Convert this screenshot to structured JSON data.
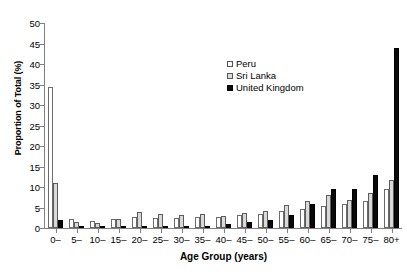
{
  "chart_data": {
    "type": "bar",
    "title": "",
    "xlabel": "Age Group (years)",
    "ylabel": "Proportion of Total (%)",
    "ylim": [
      0,
      50
    ],
    "ytick_step": 5,
    "yticks": [
      "0",
      "5",
      "10",
      "15",
      "20",
      "25",
      "30",
      "35",
      "40",
      "45",
      "50"
    ],
    "grid": false,
    "legend_position": "upper-center-right",
    "categories": [
      "0–",
      "5–",
      "10–",
      "15–",
      "20–",
      "25–",
      "30–",
      "35–",
      "40–",
      "45–",
      "50–",
      "55–",
      "60–",
      "65–",
      "70–",
      "75–",
      "80+"
    ],
    "series": [
      {
        "name": "Peru",
        "style": "open-white",
        "values": [
          34.5,
          2.2,
          1.7,
          2.1,
          2.6,
          2.4,
          2.4,
          2.8,
          2.6,
          3.1,
          3.4,
          4.2,
          4.6,
          5.3,
          5.9,
          6.6,
          9.4
        ]
      },
      {
        "name": "Sri Lanka",
        "style": "stippled-gray",
        "values": [
          11.0,
          1.5,
          1.2,
          2.3,
          3.9,
          3.4,
          3.1,
          3.3,
          3.0,
          3.7,
          4.2,
          5.7,
          6.5,
          8.1,
          6.9,
          8.5,
          11.7
        ]
      },
      {
        "name": "United Kingdom",
        "style": "solid-black",
        "values": [
          1.9,
          0.2,
          0.1,
          0.3,
          0.5,
          0.4,
          0.5,
          0.6,
          0.9,
          1.4,
          1.9,
          3.2,
          5.9,
          9.4,
          9.6,
          12.9,
          44.0
        ]
      }
    ],
    "colors": {
      "peru": "#ffffff",
      "sri_lanka": "#d9d9d9",
      "united_kingdom": "#0a0a0a",
      "axis": "#808080",
      "text": "#000000"
    }
  }
}
